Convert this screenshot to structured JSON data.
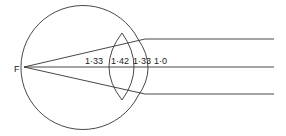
{
  "diagram": {
    "type": "eye-optics",
    "focal_point_label": "F",
    "refractive_indices": [
      {
        "medium": "aqueous humour",
        "value": "1·33"
      },
      {
        "medium": "lens",
        "value": "1·42"
      },
      {
        "medium": "vitreous/aqueous",
        "value": "1·33"
      },
      {
        "medium": "air",
        "value": "1·0"
      }
    ],
    "rays": [
      "upper-parallel-ray",
      "axial-ray",
      "lower-parallel-ray"
    ],
    "colors": {
      "line": "#333333",
      "background": "#ffffff"
    }
  }
}
